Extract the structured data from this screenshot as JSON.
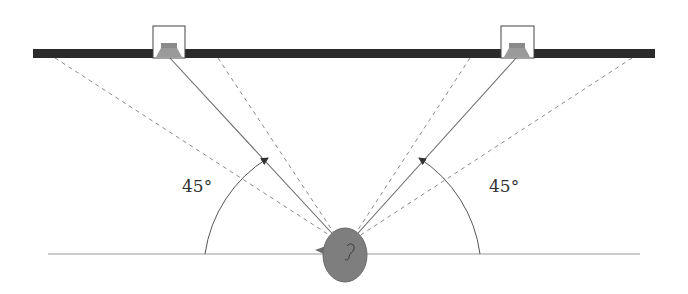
{
  "diagram": {
    "type": "stereo speaker listening position",
    "colors": {
      "wall": "#2b2b2b",
      "speaker_cone": "#8a8a8a",
      "head": "#7e7e7e",
      "lines": "#6a6a6a",
      "dashed": "#8a8a8a",
      "floor": "#9a9a9a"
    },
    "angles": {
      "left_label": "45°",
      "right_label": "45°"
    },
    "elements": {
      "left_speaker": "left-speaker",
      "right_speaker": "right-speaker",
      "listener": "listener-head"
    }
  }
}
